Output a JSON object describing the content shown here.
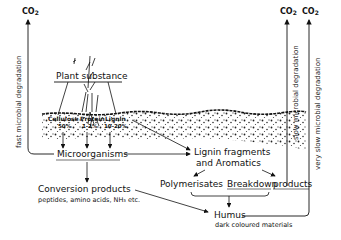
{
  "co2_labels": {
    "left": "CO",
    "left_sub": "2",
    "mid": "CO",
    "mid_sub": "2",
    "right": "CO",
    "right_sub": "2"
  },
  "vertical_labels": {
    "fast": "fast microbial degradation",
    "slow": "slow microbial degradation",
    "very_slow": "very slow microbial degradation"
  },
  "nodes": {
    "plant_substance": "Plant substance",
    "components": [
      {
        "name": "Cellulose",
        "percent": "50%"
      },
      {
        "name": "Protein",
        "percent": "1-2%"
      },
      {
        "name": "Lignin",
        "percent": "10-20%"
      }
    ],
    "microorganisms": "Microorganisms",
    "lignin_fragments_line1": "Lignin fragments",
    "lignin_fragments_line2": "and Aromatics",
    "polymerisates": "Polymerisates",
    "breakdown": "Breakdown",
    "products": "products",
    "conversion_products": "Conversion products",
    "conversion_examples": "peptides, amino acids, NH₃ etc.",
    "humus": "Humus",
    "humus_desc": "dark coloured materials"
  },
  "edges": [
    {
      "from": "plant_substance",
      "to": "components"
    },
    {
      "from": "components",
      "to": "microorganisms"
    },
    {
      "from": "microorganisms",
      "to": "CO2 (fast microbial degradation)"
    },
    {
      "from": "microorganisms",
      "to": "lignin_fragments"
    },
    {
      "from": "components",
      "to": "lignin_fragments"
    },
    {
      "from": "microorganisms",
      "to": "conversion_products"
    },
    {
      "from": "lignin_fragments",
      "to": "polymerisates"
    },
    {
      "from": "lignin_fragments",
      "to": "breakdown_products"
    },
    {
      "from": "breakdown_products",
      "to": "CO2 (slow microbial degradation)"
    },
    {
      "from": "polymerisates + breakdown",
      "to": "humus"
    },
    {
      "from": "conversion_products",
      "to": "humus"
    },
    {
      "from": "humus",
      "to": "CO2 (very slow microbial degradation)"
    }
  ]
}
